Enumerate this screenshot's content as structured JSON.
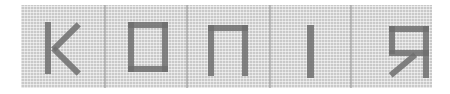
{
  "stamp": {
    "text": "КОПІЯ",
    "letters": [
      "К",
      "О",
      "П",
      "І",
      "Я"
    ],
    "colors": {
      "background": "#ffffff",
      "pattern": "#c9c9c9",
      "ink": "#6e6e6e"
    }
  }
}
